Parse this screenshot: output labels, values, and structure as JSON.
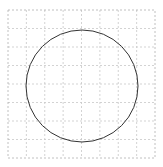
{
  "diagram": {
    "type": "circle-on-grid",
    "grid": {
      "x0": 8,
      "y0": 10,
      "x1": 155,
      "y1": 158,
      "cols": 8,
      "rows": 8,
      "color": "#c8c8c8",
      "border_color": "#b0b0b0",
      "dash": "2,2"
    },
    "circle": {
      "cx": 82,
      "cy": 86,
      "r": 56,
      "stroke": "#333333",
      "stroke_width": 1
    }
  }
}
